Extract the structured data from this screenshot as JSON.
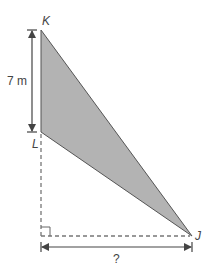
{
  "diagram": {
    "type": "geometry-triangle",
    "fill_color": "#b3b3b3",
    "stroke_color": "#555555",
    "points": {
      "K": {
        "label": "K",
        "x": 41,
        "y": 30
      },
      "L": {
        "label": "L",
        "x": 41,
        "y": 132
      },
      "J": {
        "label": "J",
        "x": 192,
        "y": 236
      }
    },
    "vertical_dimension": {
      "label": "7 m"
    },
    "horizontal_dimension": {
      "label": "?"
    },
    "right_angle_marker": true
  }
}
